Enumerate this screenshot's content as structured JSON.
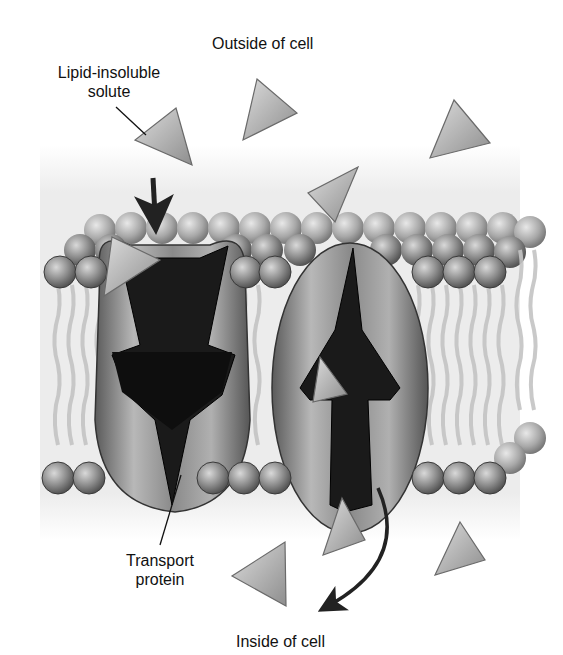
{
  "figure": {
    "type": "membrane-transport-diagram",
    "labels": {
      "outside": "Outside of cell",
      "solute_line1": "Lipid-insoluble",
      "solute_line2": "solute",
      "protein_line1": "Transport",
      "protein_line2": "protein",
      "inside": "Inside of cell"
    },
    "colors": {
      "background": "#ffffff",
      "membrane_haze": "#eeeeee",
      "phospholipid_head": "#8c8c8c",
      "phospholipid_head_dark": "#4a4a4a",
      "lipid_tail": "#c8c8c8",
      "protein_body": "#9a9a9a",
      "channel": "#1a1a1a",
      "solute": "#b5b5b5",
      "arrow": "#222222"
    },
    "elements": {
      "solutes_outside": 5,
      "solutes_inside": 3,
      "solutes_in_channel": 2,
      "transport_proteins": 2
    }
  }
}
